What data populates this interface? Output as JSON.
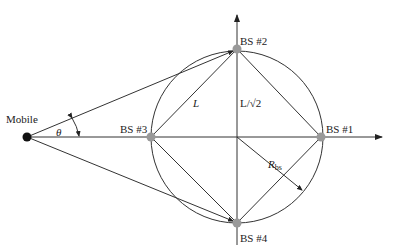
{
  "figure": {
    "type": "geometry-diagram",
    "labels": {
      "mobile": "Mobile",
      "theta": "θ",
      "bs1": "BS #1",
      "bs2": "BS #2",
      "bs3": "BS #3",
      "bs4": "BS #4",
      "side_length": "L",
      "half_diagonal": "L/√2",
      "radius_main": "R",
      "radius_sub": "bs"
    },
    "colors": {
      "line": "#333333",
      "bs_node": "#999999",
      "mobile_node": "#111111",
      "background": "#ffffff"
    }
  }
}
